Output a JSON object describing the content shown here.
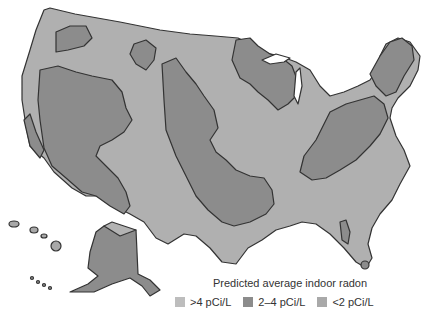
{
  "map": {
    "subject": "Predicted average indoor radon, United States",
    "colors": {
      "high": "#b3b3b3",
      "medium": "#8c8c8c",
      "low": "#a6a6a6",
      "outline": "#333333",
      "background": "#ffffff"
    }
  },
  "legend": {
    "title": "Predicted average indoor radon",
    "items": [
      {
        "label": ">4 pCi/L",
        "color": "#bdbdbd"
      },
      {
        "label": "2–4 pCi/L",
        "color": "#8c8c8c"
      },
      {
        "label": "<2 pCi/L",
        "color": "#a9a9a9"
      }
    ]
  }
}
